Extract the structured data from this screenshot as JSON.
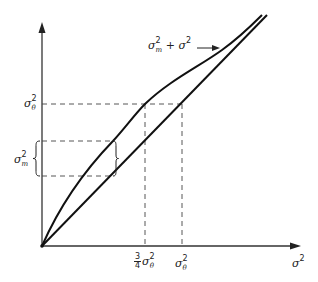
{
  "figure": {
    "colors": {
      "ink": "#1a1a1a",
      "background": "#ffffff"
    },
    "axes": {
      "x_label": "σ",
      "x_label_sup": "2",
      "y_axis_label": ""
    },
    "curve_label": {
      "base": "σ",
      "sup": "2",
      "sub": "m",
      "rest": " + σ",
      "rest_sup": "2"
    },
    "y_ticks": [
      {
        "base": "σ",
        "sup": "2",
        "sub": "θ"
      }
    ],
    "x_ticks": [
      {
        "frac_num": "3",
        "frac_den": "4",
        "base": "σ",
        "sup": "2",
        "sub": "θ"
      },
      {
        "base": "σ",
        "sup": "2",
        "sub": "θ"
      }
    ],
    "bracket_label": {
      "base": "σ",
      "sup": "2",
      "sub": "m"
    }
  }
}
